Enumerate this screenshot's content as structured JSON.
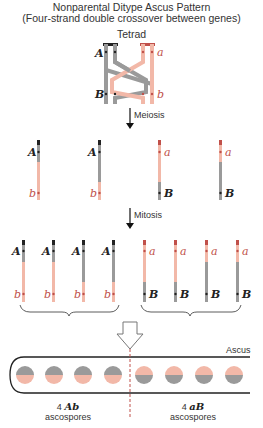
{
  "title": {
    "line1": "Nonparental Ditype Ascus Pattern",
    "line2": "(Four-strand double crossover between genes)"
  },
  "tetrad": {
    "label": "Tetrad",
    "genes": {
      "A": "A",
      "a": "a",
      "B": "B",
      "b": "b"
    }
  },
  "steps": {
    "meiosis": "Meiosis",
    "mitosis": "Mitosis"
  },
  "meiosis_products": [
    {
      "top": "A",
      "bottom": "b"
    },
    {
      "top": "A",
      "bottom": "b"
    },
    {
      "top": "a",
      "bottom": "B"
    },
    {
      "top": "a",
      "bottom": "B"
    }
  ],
  "mitosis_products": [
    {
      "top": "A",
      "bottom": "b"
    },
    {
      "top": "A",
      "bottom": "b"
    },
    {
      "top": "A",
      "bottom": "b"
    },
    {
      "top": "A",
      "bottom": "b"
    },
    {
      "top": "a",
      "bottom": "B"
    },
    {
      "top": "a",
      "bottom": "B"
    },
    {
      "top": "a",
      "bottom": "B"
    },
    {
      "top": "a",
      "bottom": "B"
    }
  ],
  "ascus": {
    "label": "Ascus",
    "left_count": "4",
    "left_genotype": "Ab",
    "left_label": "ascospores",
    "right_count": "4",
    "right_genotype": "aB",
    "right_label": "ascospores"
  },
  "colors": {
    "gray": "#9a9a9a",
    "salmon": "#f2b8a8",
    "dark": "#222222",
    "red": "#c0504a"
  }
}
